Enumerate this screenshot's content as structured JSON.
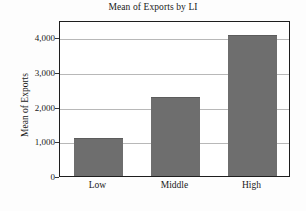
{
  "chart_data": {
    "type": "bar",
    "title": "Mean of Exports by LI",
    "xlabel": "",
    "ylabel": "Mean of Exports",
    "categories": [
      "Low",
      "Middle",
      "High"
    ],
    "values": [
      1100,
      2270,
      4070
    ],
    "ylim": [
      0,
      4500
    ],
    "yticks": [
      0,
      1000,
      2000,
      3000,
      4000
    ],
    "ytick_labels": [
      "0",
      "1,000",
      "2,000",
      "3,000",
      "4,000"
    ],
    "grid": true,
    "legend": null,
    "series": [
      {
        "name": "Mean of Exports",
        "values": [
          1100,
          2270,
          4070
        ]
      }
    ],
    "colors": {
      "bar": "#6e6e6e",
      "gridline": "#b8b8b8",
      "frame": "#1e1e1e",
      "text": "#1a1a1a",
      "background": "#ffffff"
    }
  }
}
